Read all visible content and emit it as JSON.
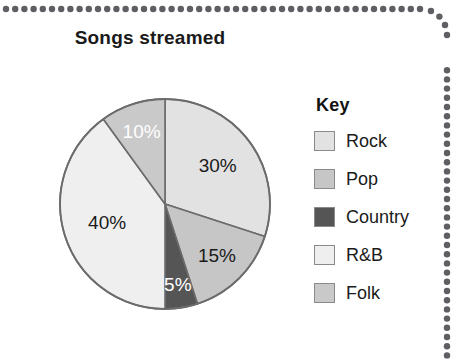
{
  "chart_data": {
    "type": "pie",
    "title": "Songs streamed",
    "categories": [
      "Rock",
      "Pop",
      "Country",
      "R&B",
      "Folk"
    ],
    "values": [
      30,
      15,
      5,
      40,
      10
    ],
    "labels": [
      "30%",
      "15%",
      "5%",
      "40%",
      "10%"
    ],
    "units": "percent",
    "start_angle_deg": 0,
    "direction": "clockwise",
    "legend_position": "right",
    "grid": false,
    "colors": [
      "#e2e2e2",
      "#c6c6c6",
      "#555555",
      "#efefef",
      "#c9c9c9"
    ],
    "label_text_colors": [
      "#1a1a1a",
      "#1a1a1a",
      "#ffffff",
      "#1a1a1a",
      "#ffffff"
    ],
    "slices": [
      {
        "name": "Rock",
        "value": 30,
        "label": "30%",
        "color": "#e2e2e2",
        "label_color": "#1a1a1a"
      },
      {
        "name": "Pop",
        "value": 15,
        "label": "15%",
        "color": "#c6c6c6",
        "label_color": "#1a1a1a"
      },
      {
        "name": "Country",
        "value": 5,
        "label": "5%",
        "color": "#555555",
        "label_color": "#ffffff"
      },
      {
        "name": "R&B",
        "value": 40,
        "label": "40%",
        "color": "#efefef",
        "label_color": "#1a1a1a"
      },
      {
        "name": "Folk",
        "value": 10,
        "label": "10%",
        "color": "#c9c9c9",
        "label_color": "#ffffff"
      }
    ],
    "outline_color": "#6b6b6b"
  },
  "legend": {
    "title": "Key",
    "items": [
      {
        "label": "Rock",
        "color": "#e2e2e2"
      },
      {
        "label": "Pop",
        "color": "#c6c6c6"
      },
      {
        "label": "Country",
        "color": "#555555"
      },
      {
        "label": "R&B",
        "color": "#efefef"
      },
      {
        "label": "Folk",
        "color": "#c9c9c9"
      }
    ]
  },
  "decoration": {
    "dot_color": "#5e5e63",
    "dot_radius": 3.2,
    "dot_spacing": 9.2
  }
}
